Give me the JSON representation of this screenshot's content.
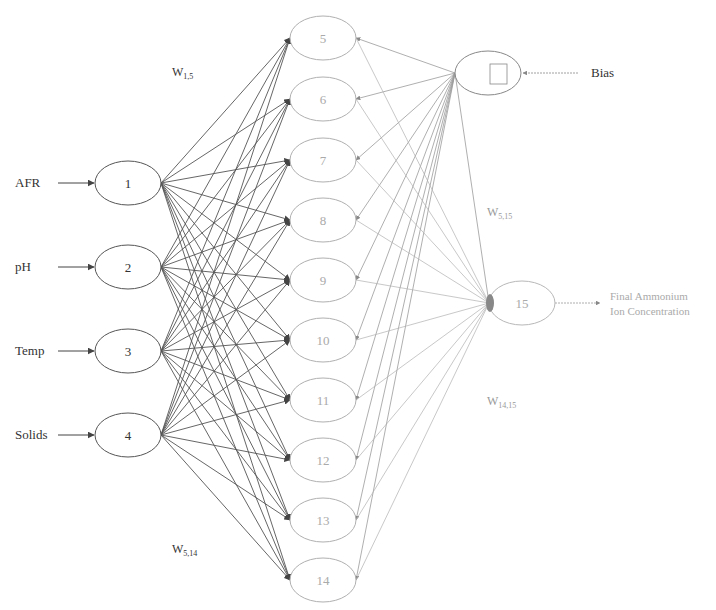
{
  "inputs": [
    {
      "id": "1",
      "label": "AFR",
      "x": 128,
      "y": 183
    },
    {
      "id": "2",
      "label": "pH",
      "x": 128,
      "y": 267
    },
    {
      "id": "3",
      "label": "Temp",
      "x": 128,
      "y": 351
    },
    {
      "id": "4",
      "label": "Solids",
      "x": 128,
      "y": 435
    }
  ],
  "hidden": [
    {
      "id": "5",
      "x": 323,
      "y": 38
    },
    {
      "id": "6",
      "x": 323,
      "y": 99
    },
    {
      "id": "7",
      "x": 323,
      "y": 160
    },
    {
      "id": "8",
      "x": 323,
      "y": 220
    },
    {
      "id": "9",
      "x": 323,
      "y": 280
    },
    {
      "id": "10",
      "x": 323,
      "y": 340
    },
    {
      "id": "11",
      "x": 323,
      "y": 400
    },
    {
      "id": "12",
      "x": 323,
      "y": 460
    },
    {
      "id": "13",
      "x": 323,
      "y": 520
    },
    {
      "id": "14",
      "x": 323,
      "y": 580
    }
  ],
  "bias": {
    "label": "Bias",
    "x": 488,
    "y": 73
  },
  "output": {
    "id": "15",
    "x": 522,
    "y": 303,
    "label_line1": "Final Ammonium",
    "label_line2": "Ion Concentration"
  },
  "weights": {
    "w_1_5": {
      "main": "W",
      "sub": "1,5",
      "x": 172,
      "y": 76
    },
    "w_5_14": {
      "main": "W",
      "sub": "5,14",
      "x": 172,
      "y": 553
    },
    "w_5_15": {
      "main": "W",
      "sub": "5,15",
      "x": 487,
      "y": 216
    },
    "w_14_15": {
      "main": "W",
      "sub": "14,15",
      "x": 487,
      "y": 405
    }
  },
  "colors": {
    "input_stroke": "#555555",
    "hidden_stroke": "#b0b0b0",
    "edge_input": "#555555",
    "edge_output": "#9a9a9a",
    "text": "#333333",
    "hidden_text": "#aaaaaa"
  }
}
